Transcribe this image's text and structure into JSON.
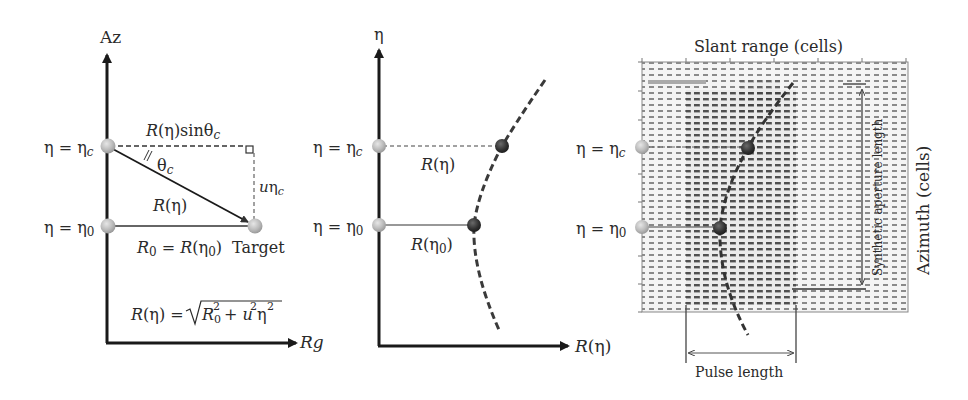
{
  "panel1": {
    "axis_y_label": "Az",
    "axis_x_label": "Rg",
    "eta_c_label": "η = η",
    "eta_c_sub": "c",
    "eta_0_label": "η = η",
    "eta_0_sub": "0",
    "top_segment_label": "R(η)sinθ",
    "top_segment_sub": "c",
    "angle_label": "θ",
    "angle_sub": "c",
    "vertical_segment_label": "uη",
    "vertical_segment_sub": "c",
    "slant_label": "R(η)",
    "r0_label": "R",
    "r0_sub": "0",
    "r0_eq": " = R(η",
    "r0_eq_sub": "0",
    "r0_close": ")",
    "target_label": "Target",
    "formula_lhs": "R(η) = ",
    "formula_r": "R",
    "formula_r_sub": "0",
    "formula_r_sup": "2",
    "formula_plus": " + u",
    "formula_u_sup": "2",
    "formula_eta": "η",
    "formula_eta_sup": "2"
  },
  "panel2": {
    "axis_y_label": "η",
    "axis_x_label": "R(η)",
    "eta_c_label": "η = η",
    "eta_c_sub": "c",
    "eta_0_label": "η = η",
    "eta_0_sub": "0",
    "range_c_label": "R(η)",
    "range_0_label": "R(η",
    "range_0_sub": "0",
    "range_0_close": ")"
  },
  "panel3": {
    "title": "Slant range (cells)",
    "side_label": "Azimuth (cells)",
    "aperture_label": "Synthetic aperture length",
    "pulse_label": "Pulse length",
    "eta_c_label": "η = η",
    "eta_c_sub": "c",
    "eta_0_label": "η = η",
    "eta_0_sub": "0"
  },
  "colors": {
    "axis": "#1a1a1a",
    "dot_light": "#b9b9b9",
    "dot_dark": "#3a3a3a",
    "grid_dot": "#555555"
  }
}
